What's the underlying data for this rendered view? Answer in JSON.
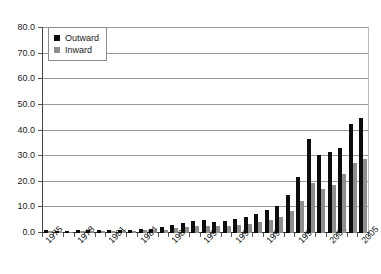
{
  "chart_data": {
    "type": "bar",
    "title": "",
    "xlabel": "",
    "ylabel": "",
    "ylim": [
      0,
      80
    ],
    "ytick_step": 10,
    "ytick_labels": [
      "0.0",
      "10.0",
      "20.0",
      "30.0",
      "40.0",
      "50.0",
      "60.0",
      "70.0",
      "80.0"
    ],
    "grid": true,
    "legend_position": "top-left",
    "legend": [
      "Outward",
      "Inward"
    ],
    "colors": {
      "outward": "#0d0d0d",
      "inward": "#8e8e8e",
      "gridline": "#9a9a9a",
      "axis": "#333333",
      "background": "#ffffff"
    },
    "categories": [
      "1975",
      "1976",
      "1977",
      "1978",
      "1979",
      "1980",
      "1981",
      "1982",
      "1983",
      "1984",
      "1985",
      "1986",
      "1987",
      "1988",
      "1989",
      "1990",
      "1991",
      "1992",
      "1993",
      "1994",
      "1995",
      "1996",
      "1997",
      "1998",
      "1999",
      "2000",
      "2001",
      "2002",
      "2003",
      "2004",
      "2005"
    ],
    "xtick_labels_shown": [
      "1975",
      "1978",
      "1981",
      "1984",
      "1987",
      "1990",
      "1993",
      "1996",
      "1999",
      "2002",
      "2005"
    ],
    "xtick_label_interval": 3,
    "series": [
      {
        "name": "Outward",
        "values": [
          1.0,
          0.8,
          0.9,
          1.1,
          1.3,
          1.2,
          1.1,
          1.0,
          1.2,
          1.4,
          1.6,
          2.2,
          3.0,
          4.0,
          4.6,
          5.0,
          4.4,
          4.6,
          5.4,
          6.2,
          7.5,
          8.8,
          10.4,
          14.8,
          22.0,
          36.5,
          30.5,
          31.5,
          33.0,
          42.5,
          45.0
        ]
      },
      {
        "name": "Inward",
        "values": [
          0.6,
          0.5,
          0.5,
          0.6,
          0.8,
          0.9,
          0.9,
          0.8,
          0.9,
          1.0,
          1.1,
          1.3,
          1.8,
          2.2,
          2.6,
          2.8,
          2.6,
          2.7,
          3.1,
          3.6,
          4.2,
          5.0,
          6.2,
          8.4,
          12.5,
          19.5,
          17.0,
          18.8,
          23.0,
          27.5,
          29.0
        ]
      }
    ],
    "note_series_scaled": false
  },
  "chart_data_display": {
    "outward": [
      1.0,
      0.8,
      0.9,
      1.1,
      1.3,
      1.2,
      1.1,
      1.0,
      1.2,
      1.4,
      1.6,
      2.2,
      3.0,
      4.0,
      4.6,
      5.0,
      4.4,
      4.6,
      5.4,
      6.2,
      7.5,
      8.8,
      10.4,
      14.8,
      22.0,
      36.5,
      30.5,
      31.5,
      33.0,
      42.5,
      45.0
    ],
    "inward": [
      0.6,
      0.5,
      0.5,
      0.6,
      0.8,
      0.9,
      0.9,
      0.8,
      0.9,
      1.0,
      1.1,
      1.3,
      1.8,
      2.2,
      2.6,
      2.8,
      2.6,
      2.7,
      3.1,
      3.6,
      4.2,
      5.0,
      6.2,
      8.4,
      12.5,
      19.5,
      17.0,
      18.8,
      23.0,
      27.5,
      29.0
    ]
  },
  "plot_geometry": {
    "left": 42,
    "right": 368,
    "top": 27,
    "bottom": 232
  }
}
